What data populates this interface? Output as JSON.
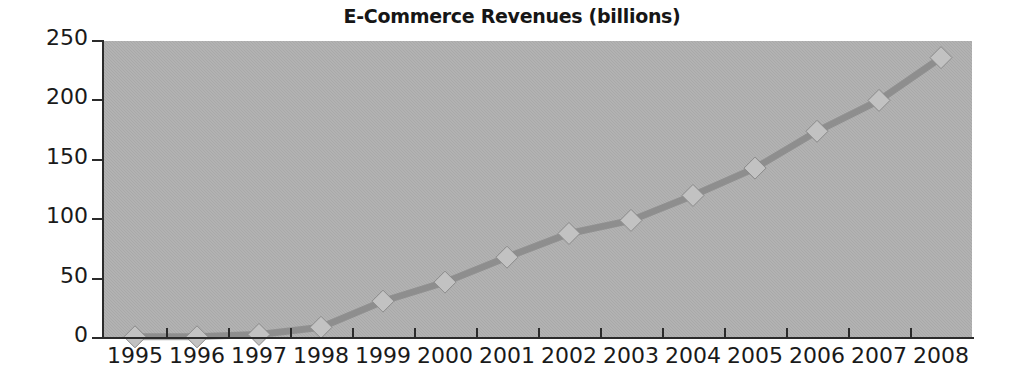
{
  "chart_data": {
    "type": "line",
    "title": "E-Commerce Revenues (billions)",
    "xlabel": "",
    "ylabel": "",
    "categories": [
      "1995",
      "1996",
      "1997",
      "1998",
      "1999",
      "2000",
      "2001",
      "2002",
      "2003",
      "2004",
      "2005",
      "2006",
      "2007",
      "2008"
    ],
    "values": [
      1,
      1,
      3,
      9,
      31,
      47,
      68,
      88,
      99,
      120,
      143,
      174,
      200,
      236
    ],
    "series": [
      {
        "name": "E-Commerce Revenues",
        "values": [
          1,
          1,
          3,
          9,
          31,
          47,
          68,
          88,
          99,
          120,
          143,
          174,
          200,
          236
        ]
      }
    ],
    "ylim": [
      0,
      250
    ],
    "yticks": [
      0,
      50,
      100,
      150,
      200,
      250
    ],
    "ytick_labels": [
      "0",
      "50",
      "100",
      "150",
      "200",
      "250"
    ],
    "grid": false,
    "legend": false,
    "marker": "diamond",
    "plot_background_color": "#a9a9a9",
    "line_color": "#8e8e8e",
    "marker_color": "#c2c2c2",
    "axis_color": "#2b2b2b",
    "text_color": "#1a1a1a"
  }
}
